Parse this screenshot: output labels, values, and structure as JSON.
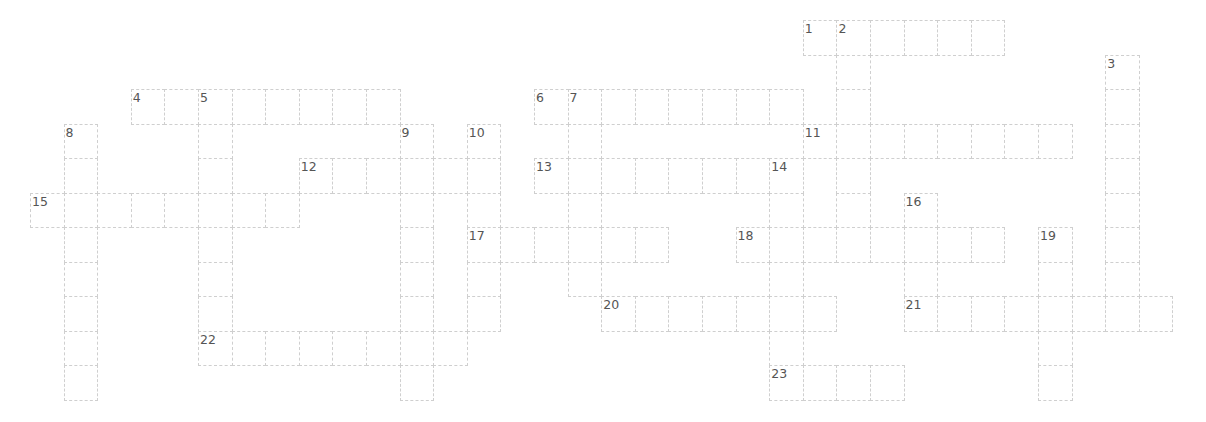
{
  "puzzle": {
    "type": "crossword",
    "line_color": "#cfcfcf",
    "number_color": "#555555",
    "across": [
      {
        "number": "1",
        "row": 0,
        "col": 23,
        "length": 6
      },
      {
        "number": "4",
        "row": 2,
        "col": 3,
        "length": 8
      },
      {
        "number": "6",
        "row": 2,
        "col": 15,
        "length": 8
      },
      {
        "number": "11",
        "row": 3,
        "col": 23,
        "length": 8
      },
      {
        "number": "12",
        "row": 4,
        "col": 8,
        "length": 6
      },
      {
        "number": "13",
        "row": 4,
        "col": 15,
        "length": 7
      },
      {
        "number": "15",
        "row": 5,
        "col": 0,
        "length": 8
      },
      {
        "number": "17",
        "row": 6,
        "col": 13,
        "length": 6
      },
      {
        "number": "18",
        "row": 6,
        "col": 21,
        "length": 8
      },
      {
        "number": "20",
        "row": 8,
        "col": 17,
        "length": 7
      },
      {
        "number": "21",
        "row": 8,
        "col": 26,
        "length": 8
      },
      {
        "number": "22",
        "row": 9,
        "col": 5,
        "length": 8
      },
      {
        "number": "23",
        "row": 10,
        "col": 22,
        "length": 4
      }
    ],
    "down": [
      {
        "number": "2",
        "row": 0,
        "col": 24,
        "length": 7
      },
      {
        "number": "3",
        "row": 1,
        "col": 32,
        "length": 8
      },
      {
        "number": "5",
        "row": 2,
        "col": 5,
        "length": 8
      },
      {
        "number": "7",
        "row": 2,
        "col": 16,
        "length": 6
      },
      {
        "number": "8",
        "row": 3,
        "col": 1,
        "length": 8
      },
      {
        "number": "9",
        "row": 3,
        "col": 11,
        "length": 8
      },
      {
        "number": "10",
        "row": 3,
        "col": 13,
        "length": 6
      },
      {
        "number": "14",
        "row": 4,
        "col": 22,
        "length": 7
      },
      {
        "number": "16",
        "row": 5,
        "col": 26,
        "length": 4
      },
      {
        "number": "19",
        "row": 6,
        "col": 30,
        "length": 5
      }
    ]
  }
}
